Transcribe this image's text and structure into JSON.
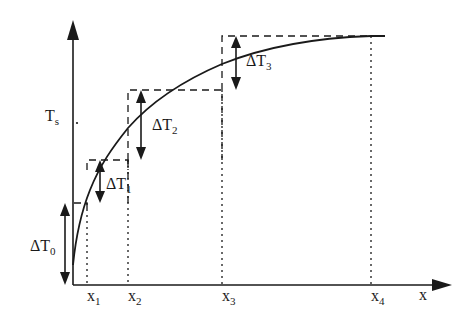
{
  "diagram": {
    "type": "step-approximation-of-curve",
    "axes": {
      "y_label": {
        "main": "T",
        "sub": "s"
      },
      "x_label": "x"
    },
    "x_ticks": [
      {
        "main": "x",
        "sub": "1"
      },
      {
        "main": "x",
        "sub": "2"
      },
      {
        "main": "x",
        "sub": "3"
      },
      {
        "main": "x",
        "sub": "4"
      }
    ],
    "increments": [
      {
        "main": "ΔT",
        "sub": "0"
      },
      {
        "main": "ΔT",
        "sub": "1"
      },
      {
        "main": "ΔT",
        "sub": "2"
      },
      {
        "main": "ΔT",
        "sub": "3"
      }
    ],
    "colors": {
      "line": "#1a1a1a",
      "background": "#ffffff"
    }
  }
}
